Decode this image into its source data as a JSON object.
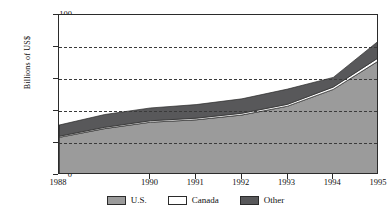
{
  "chart_data": {
    "type": "area",
    "stacked": true,
    "title": "",
    "xlabel": "",
    "ylabel": "Billions of US$",
    "x": [
      1988,
      1989,
      1990,
      1991,
      1992,
      1993,
      1994,
      1995
    ],
    "categories": [
      "1988",
      "1989",
      "1990",
      "1991",
      "1992",
      "1993",
      "1994",
      "1995"
    ],
    "tick_labels": [
      "1988",
      "1990",
      "1991",
      "1992",
      "1993",
      "1994",
      "1995"
    ],
    "ytick_labels": [
      "0",
      "20",
      "40",
      "60",
      "80",
      "100"
    ],
    "yticks": [
      0,
      20,
      40,
      60,
      80,
      100
    ],
    "ylim": [
      0,
      100
    ],
    "xlim": [
      1988,
      1995
    ],
    "grid": "horizontal-dashed",
    "legend_position": "bottom-center",
    "series": [
      {
        "name": "U.S.",
        "color": "#9b9b9b",
        "values": [
          23.5,
          29.0,
          33.0,
          34.5,
          37.5,
          43.0,
          53.5,
          71.5
        ]
      },
      {
        "name": "Canada",
        "color": "#ffffff",
        "values": [
          0.7,
          0.8,
          0.9,
          1.0,
          1.1,
          1.2,
          1.5,
          2.0
        ]
      },
      {
        "name": "Other",
        "color": "#58585a",
        "values": [
          7.0,
          8.0,
          8.0,
          8.5,
          9.0,
          9.5,
          6.0,
          10.5
        ]
      }
    ],
    "cumulative_totals": [
      31.2,
      37.8,
      41.9,
      44.0,
      47.6,
      53.7,
      61.0,
      84.0
    ]
  },
  "legend": {
    "items": [
      {
        "label": "U.S.",
        "color": "#9b9b9b"
      },
      {
        "label": "Canada",
        "color": "#ffffff"
      },
      {
        "label": "Other",
        "color": "#58585a"
      }
    ]
  }
}
